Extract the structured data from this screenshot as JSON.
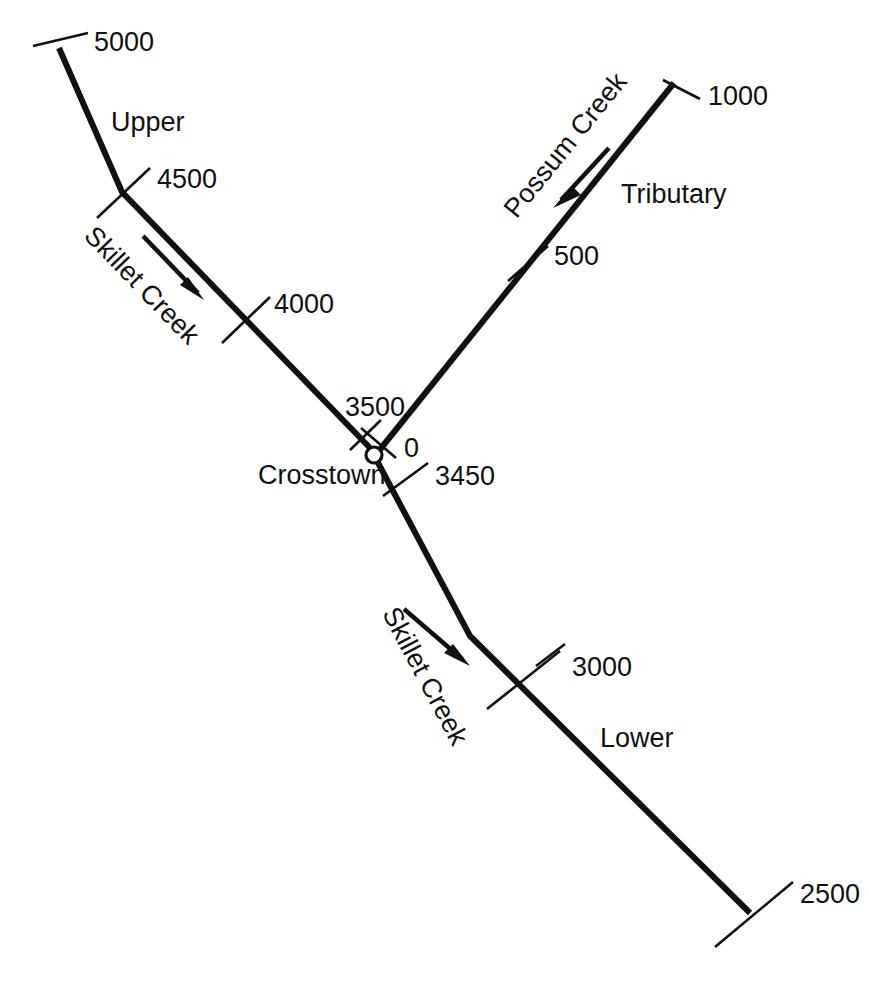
{
  "diagram": {
    "background_color": "#ffffff",
    "line_color": "#111111",
    "width": 869,
    "height": 981,
    "node": {
      "name": "Crosstown",
      "label": "Crosstown",
      "marker": "confluence-circle"
    },
    "streams": [
      {
        "id": "skillet-upper",
        "name": "Skillet Creek",
        "reach": "Upper",
        "creek_label": "Skillet Creek",
        "reach_label": "Upper",
        "flow_direction": "downstream-southeast",
        "stations": [
          "5000",
          "4500",
          "4000",
          "3500"
        ]
      },
      {
        "id": "possum-tributary",
        "name": "Possum Creek",
        "reach": "Tributary",
        "creek_label": "Possum Creek",
        "reach_label": "Tributary",
        "flow_direction": "downstream-southwest",
        "stations": [
          "1000",
          "500",
          "0"
        ]
      },
      {
        "id": "skillet-lower",
        "name": "Skillet Creek",
        "reach": "Lower",
        "creek_label": "Skillet Creek",
        "reach_label": "Lower",
        "flow_direction": "downstream-southeast",
        "stations": [
          "3450",
          "3000",
          "2500"
        ]
      }
    ],
    "labels": {
      "station_5000": "5000",
      "station_4500": "4500",
      "station_4000": "4000",
      "station_3500": "3500",
      "station_0": "0",
      "station_3450": "3450",
      "station_3000": "3000",
      "station_2500": "2500",
      "station_1000": "1000",
      "station_500": "500",
      "reach_upper": "Upper",
      "reach_tributary": "Tributary",
      "reach_lower": "Lower",
      "creek_skillet_upper": "Skillet Creek",
      "creek_possum": "Possum Creek",
      "creek_skillet_lower": "Skillet Creek",
      "node_crosstown": "Crosstown"
    }
  }
}
